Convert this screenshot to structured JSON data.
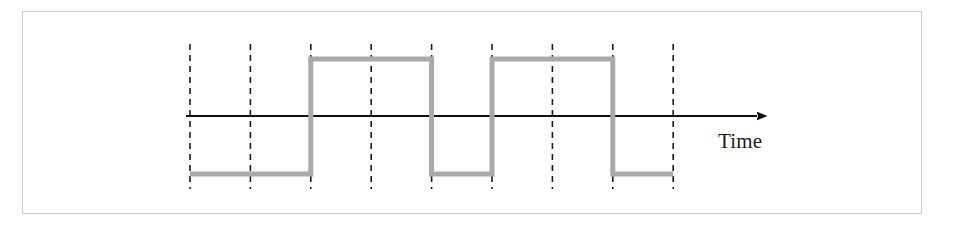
{
  "figure": {
    "background_color": "#ffffff",
    "frame": {
      "border_color": "#c9c9c9",
      "x": 22,
      "y": 11,
      "width": 900,
      "height": 203
    }
  },
  "axis": {
    "time_label": "Time",
    "label_x": 718,
    "label_y": 148,
    "line_color": "#111111",
    "line_y": 116,
    "line_start_x": 186,
    "line_end_x": 757,
    "arrowhead": "solid-triangle-right",
    "arrow_color": "#111111"
  },
  "gridlines": {
    "color": "#1a1a1a",
    "dash": "6 5",
    "width": 1.6,
    "top_y": 44,
    "bottom_y": 189,
    "x_positions": [
      190,
      250.4,
      310.8,
      371.2,
      431.6,
      492,
      552.4,
      612.8,
      673.2
    ]
  },
  "waveform": {
    "color": "#a9a9a9",
    "stroke_width": 5,
    "high_y": 59,
    "low_y": 174,
    "start_x": 190,
    "end_x": 673.2,
    "levels": [
      "low",
      "low",
      "high",
      "high",
      "low",
      "high",
      "high",
      "low"
    ],
    "points": [
      [
        190,
        174
      ],
      [
        310.8,
        174
      ],
      [
        310.8,
        59
      ],
      [
        431.6,
        59
      ],
      [
        431.6,
        174
      ],
      [
        492,
        174
      ],
      [
        492,
        59
      ],
      [
        612.8,
        59
      ],
      [
        612.8,
        174
      ],
      [
        673.2,
        174
      ]
    ]
  },
  "chart_data": {
    "type": "line",
    "xlabel": "Time",
    "ylabel": "",
    "grid": true,
    "legend": "none",
    "categories": [
      "t0",
      "t1",
      "t2",
      "t3",
      "t4",
      "t5",
      "t6",
      "t7",
      "t8"
    ],
    "x": [
      0,
      1,
      2,
      3,
      4,
      5,
      6,
      7,
      8
    ],
    "series": [
      {
        "name": "signal",
        "style": "square-wave",
        "values": [
          -1,
          -1,
          1,
          1,
          -1,
          1,
          1,
          -1,
          -1
        ]
      }
    ],
    "ylim": [
      -1.5,
      1.5
    ],
    "xlim": [
      0,
      8
    ],
    "annotations": [
      "Time"
    ]
  }
}
